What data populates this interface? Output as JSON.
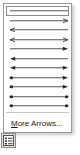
{
  "panel": {
    "name": "Arrows",
    "selected_index": 0,
    "items": [
      {
        "label": "Line (no arrowheads)",
        "start": "none",
        "end": "none"
      },
      {
        "label": "Arrow (open, right)",
        "start": "none",
        "end": "open"
      },
      {
        "label": "Arrow (open, left)",
        "start": "open",
        "end": "none"
      },
      {
        "label": "Double arrow (open)",
        "start": "open",
        "end": "open"
      },
      {
        "label": "Arrow (filled, right)",
        "start": "none",
        "end": "filled"
      },
      {
        "label": "Arrow (filled, left)",
        "start": "filled",
        "end": "none"
      },
      {
        "label": "Double arrow (filled)",
        "start": "filled",
        "end": "filled"
      },
      {
        "label": "Dot to arrow",
        "start": "dot",
        "end": "filled"
      },
      {
        "label": "Dot to arrow 2",
        "start": "dot",
        "end": "filled"
      },
      {
        "label": "Dot to dot (arrow)",
        "start": "dot",
        "end": "dot"
      },
      {
        "label": "Dot to dot",
        "start": "dot",
        "end": "dot"
      }
    ],
    "more_command": {
      "accel": "M",
      "rest": "ore Arrows..."
    }
  },
  "launcher": {
    "label": "Line Style",
    "icon": "line-style-icon"
  },
  "colors": {
    "stroke": "#2b2b2b",
    "panel_border": "#9a9a9a",
    "selection_border": "#8b8b8b",
    "separator": "#c9c9c9",
    "button_face": "#e4e2dd",
    "text": "#1a1a1a"
  }
}
